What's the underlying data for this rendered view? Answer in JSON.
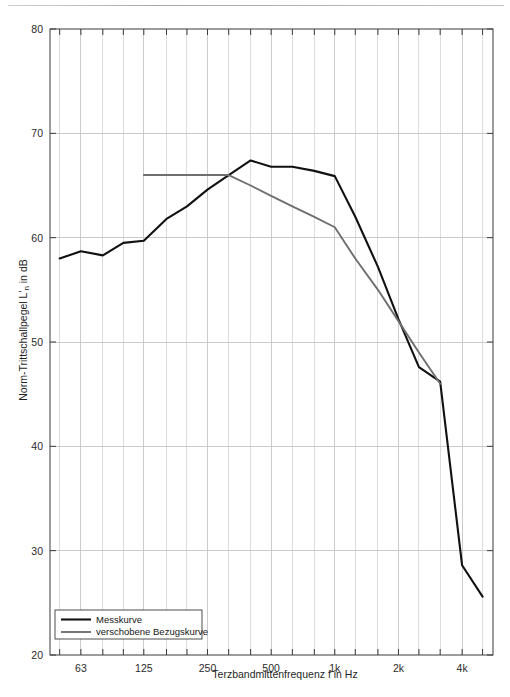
{
  "chart_data": {
    "type": "line",
    "title": "",
    "xlabel": "Terzbandmittenfrequenz f in Hz",
    "ylabel": "Norm-Trittschallpegel L'n in dB",
    "ylabel_parts": {
      "pre": "Norm-Trittschallpegel L'",
      "sub": "n",
      "post": " in dB"
    },
    "grid": true,
    "legend_position": "bottom-left",
    "xscale": "log",
    "xlim": [
      45,
      5600
    ],
    "ylim": [
      20,
      80
    ],
    "yticks": [
      20,
      30,
      40,
      50,
      60,
      70,
      80
    ],
    "ytick_labels": [
      "20",
      "30",
      "40",
      "50",
      "60",
      "70",
      "80"
    ],
    "xticks": [
      63,
      125,
      250,
      500,
      1000,
      2000,
      4000
    ],
    "xtick_labels": [
      "63",
      "125",
      "250",
      "500",
      "1k",
      "2k",
      "4k"
    ],
    "x_minor_ticks": [
      50,
      63,
      80,
      100,
      125,
      160,
      200,
      250,
      315,
      400,
      500,
      630,
      800,
      1000,
      1250,
      1600,
      2000,
      2500,
      3150,
      4000,
      5000
    ],
    "series": [
      {
        "name": "Messkurve",
        "color": "#111111",
        "x": [
          50,
          63,
          80,
          100,
          125,
          160,
          200,
          250,
          315,
          400,
          500,
          630,
          800,
          1000,
          1250,
          1600,
          2000,
          2500,
          3150,
          4000,
          5000
        ],
        "values": [
          58.0,
          58.7,
          58.3,
          59.5,
          59.7,
          61.8,
          63.0,
          64.6,
          66.0,
          67.4,
          66.8,
          66.8,
          66.4,
          65.9,
          62.0,
          57.2,
          52.2,
          47.6,
          46.2,
          28.6,
          25.6
        ]
      },
      {
        "name": "verschobene Bezugskurve",
        "color": "#6f6f6f",
        "x": [
          125,
          160,
          200,
          250,
          315,
          400,
          500,
          630,
          800,
          1000,
          1250,
          1600,
          2000,
          2500,
          3150
        ],
        "values": [
          66.0,
          66.0,
          66.0,
          66.0,
          66.0,
          65.0,
          64.0,
          63.0,
          62.0,
          61.0,
          58.0,
          55.0,
          52.0,
          49.0,
          46.0
        ]
      }
    ],
    "legend": [
      {
        "label": "Messkurve",
        "color": "#111111"
      },
      {
        "label": "verschobene Bezugskurve",
        "color": "#6f6f6f"
      }
    ]
  },
  "colors": {
    "measured": "#111111",
    "reference": "#6f6f6f",
    "grid": "#d4d4d8",
    "axis": "#3a3a3a",
    "background": "#ffffff"
  }
}
